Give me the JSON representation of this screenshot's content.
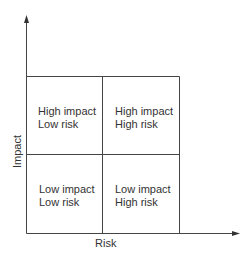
{
  "diagram": {
    "type": "2x2 matrix",
    "x_axis_label": "Risk",
    "y_axis_label": "Impact",
    "quadrants": {
      "top_left": {
        "line1": "High impact",
        "line2": "Low risk"
      },
      "top_right": {
        "line1": "High impact",
        "line2": "High risk"
      },
      "bottom_left": {
        "line1": "Low impact",
        "line2": "Low risk"
      },
      "bottom_right": {
        "line1": "Low impact",
        "line2": "High risk"
      }
    },
    "line_color": "#333333"
  }
}
